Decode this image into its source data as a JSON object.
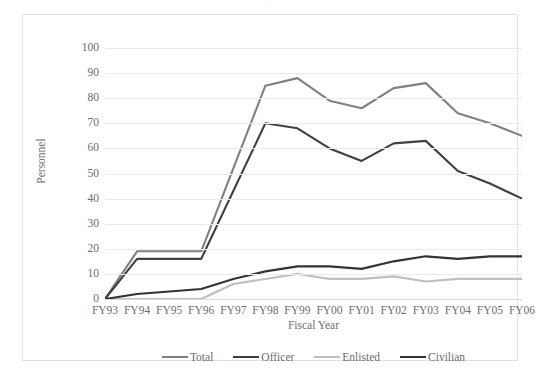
{
  "clipped_title": "·",
  "chart_data": {
    "type": "line",
    "title": "",
    "xlabel": "Fiscal Year",
    "ylabel": "Personnel",
    "categories": [
      "FY93",
      "FY94",
      "FY95",
      "FY96",
      "FY97",
      "FY98",
      "FY99",
      "FY00",
      "FY01",
      "FY02",
      "FY03",
      "FY04",
      "FY05",
      "FY06"
    ],
    "ylim": [
      0,
      100
    ],
    "yticks": [
      0,
      10,
      20,
      30,
      40,
      50,
      60,
      70,
      80,
      90,
      100
    ],
    "grid": true,
    "legend_position": "bottom",
    "series": [
      {
        "name": "Total",
        "color": "#808080",
        "values": [
          0,
          19,
          19,
          19,
          52,
          85,
          88,
          79,
          76,
          84,
          86,
          74,
          70,
          65
        ]
      },
      {
        "name": "Officer",
        "color": "#404040",
        "values": [
          0,
          16,
          16,
          16,
          43,
          70,
          68,
          60,
          55,
          62,
          63,
          51,
          46,
          40
        ]
      },
      {
        "name": "Enlisted",
        "color": "#bfbfbf",
        "values": [
          0,
          0,
          0,
          0,
          6,
          8,
          10,
          8,
          8,
          9,
          7,
          8,
          8,
          8
        ]
      },
      {
        "name": "Civilian",
        "color": "#333333",
        "values": [
          0,
          2,
          3,
          4,
          8,
          11,
          13,
          13,
          12,
          15,
          17,
          16,
          17,
          17
        ]
      }
    ]
  }
}
